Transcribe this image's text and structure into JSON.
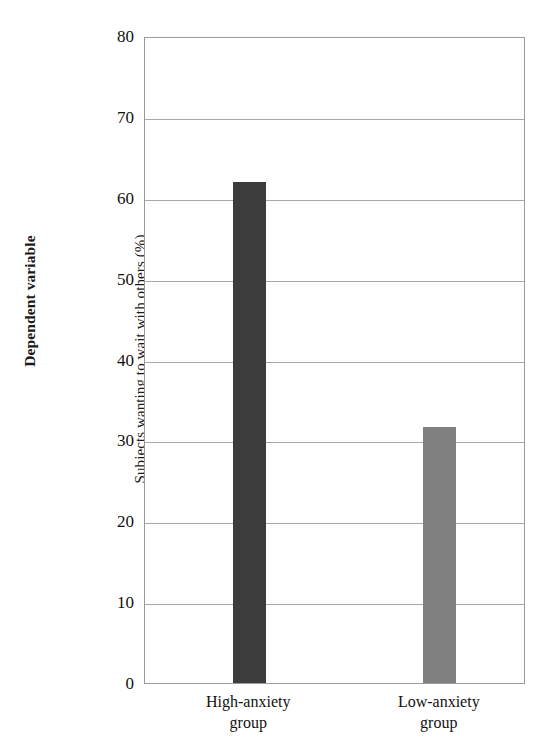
{
  "chart_data": {
    "type": "bar",
    "title": "",
    "subtitle": "",
    "categories": [
      "High-anxiety group",
      "Low-anxiety group"
    ],
    "category_lines": [
      [
        "High-anxiety",
        "group"
      ],
      [
        "Low-anxiety",
        "group"
      ]
    ],
    "values": [
      62.0,
      31.6
    ],
    "bar_colors": [
      "#3c3c3c",
      "#808080"
    ],
    "xlabel": "",
    "ylabel": "Subjects wanting to wait with others (%)",
    "axis_group_label": "Dependent variable",
    "ylim": [
      0,
      80
    ],
    "yticks": [
      80,
      70,
      60,
      50,
      40,
      30,
      20,
      10,
      0
    ],
    "ytick_labels": [
      "80",
      "70",
      "60",
      "50",
      "40",
      "30",
      "20",
      "10",
      "0"
    ],
    "grid": true,
    "grid_axis": "y",
    "legend": false,
    "legend_position": "none"
  },
  "axis": {
    "dependent_variable_label": "Dependent variable",
    "y_title": "Subjects wanting to wait with others (%)"
  }
}
